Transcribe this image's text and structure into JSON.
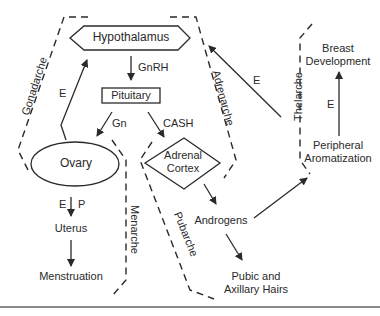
{
  "nodes": {
    "hypothalamus": "Hypothalamus",
    "pituitary": "Pituitary",
    "ovary": "Ovary",
    "adrenal_cortex_line1": "Adrenal",
    "adrenal_cortex_line2": "Cortex",
    "uterus": "Uterus",
    "menstruation": "Menstruation",
    "androgens": "Androgens",
    "pubic_hairs_line1": "Pubic and",
    "pubic_hairs_line2": "Axillary Hairs",
    "peripheral_line1": "Peripheral",
    "peripheral_line2": "Aromatization",
    "breast_line1": "Breast",
    "breast_line2": "Development"
  },
  "edge_labels": {
    "gnrh": "GnRH",
    "gn": "Gn",
    "cash": "CASH",
    "e_ovary_hypothalamus": "E",
    "e_ovary_uterus": "E",
    "p_ovary_uterus": "P",
    "e_peripheral_hypothalamus": "E",
    "e_peripheral_breast": "E"
  },
  "regions": {
    "gonadarche": "Gonadarche",
    "adrenarche": "Adrenarche",
    "thelarche": "Thelarche",
    "menarche": "Menarche",
    "pubarche": "Pubarche"
  },
  "colors": {
    "ink": "#2a2a2a",
    "background": "#ffffff",
    "rule": "#8a8a8a"
  }
}
